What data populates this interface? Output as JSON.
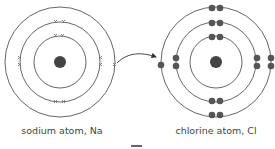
{
  "labels": {
    "sodium": "sodium atom, Na",
    "chlorine": "chlorine atom, Cl"
  },
  "colors": {
    "ring": "#555555",
    "nucleus": "#444444",
    "electron_dot": "#555555",
    "cross": "#777777",
    "text": "#444444"
  },
  "sodium_atom": {
    "center": [
      60,
      62
    ],
    "shell_radii": [
      26,
      40,
      55
    ],
    "electron_marker": "cross",
    "shell_electrons": [
      2,
      8,
      1
    ]
  },
  "chlorine_atom": {
    "center": [
      216,
      62
    ],
    "shell_radii": [
      26,
      40,
      55
    ],
    "electron_marker": "dot",
    "shell_electrons": [
      2,
      8,
      8
    ],
    "transferred_electron": 1
  },
  "arrow": {
    "from": "sodium outer electron",
    "to": "chlorine outer shell"
  }
}
